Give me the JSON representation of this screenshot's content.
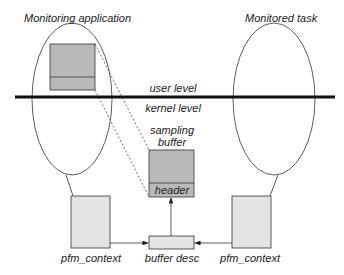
{
  "diagram": {
    "left_process": {
      "label": "Monitoring application"
    },
    "right_process": {
      "label": "Monitored task"
    },
    "boundary": {
      "upper_label": "user level",
      "lower_label": "kernel level"
    },
    "sampling_buffer": {
      "label_line1": "sampling",
      "label_line2": "buffer",
      "header_label": "header"
    },
    "left_context": {
      "label": "pfm_context"
    },
    "right_context": {
      "label": "pfm_context"
    },
    "buffer_desc": {
      "label": "buffer desc"
    },
    "colors": {
      "dark_fill": "#b9b9b9",
      "light_fill": "#e3e3e3",
      "line": "#333333"
    }
  }
}
